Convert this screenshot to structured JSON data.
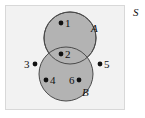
{
  "figure": {
    "type": "venn-diagram",
    "width": 145,
    "height": 118,
    "background_color": "#ffffff"
  },
  "universe": {
    "label": "S",
    "fill_color": "#f2f2f2",
    "border_color": "#d8d8d8",
    "x": 5,
    "y": 5,
    "width": 120,
    "height": 105
  },
  "sets": [
    {
      "label": "A",
      "cx": 70,
      "cy": 38,
      "r": 26,
      "fill_color": "#b3b3b3",
      "border_color": "#4a4a4a"
    },
    {
      "label": "B",
      "cx": 66,
      "cy": 74,
      "r": 27,
      "fill_color": "#b3b3b3",
      "border_color": "#4a4a4a"
    }
  ],
  "elements": [
    {
      "label": "1",
      "dot_x": 61,
      "dot_y": 23,
      "label_x": 65,
      "label_y": 18,
      "region": "A-only"
    },
    {
      "label": "2",
      "dot_x": 61,
      "dot_y": 54,
      "label_x": 65,
      "label_y": 49,
      "region": "A-and-B"
    },
    {
      "label": "3",
      "dot_x": 35,
      "dot_y": 64,
      "label_x": 24,
      "label_y": 59,
      "region": "outside"
    },
    {
      "label": "4",
      "dot_x": 46,
      "dot_y": 80,
      "label_x": 50,
      "label_y": 75,
      "region": "B-only"
    },
    {
      "label": "5",
      "dot_x": 100,
      "dot_y": 64,
      "label_x": 104,
      "label_y": 59,
      "region": "outside"
    },
    {
      "label": "6",
      "dot_x": 79,
      "dot_y": 80,
      "label_x": 69,
      "label_y": 75,
      "region": "B-only"
    }
  ],
  "dot_style": {
    "radius": 2.4,
    "color": "#111111"
  }
}
